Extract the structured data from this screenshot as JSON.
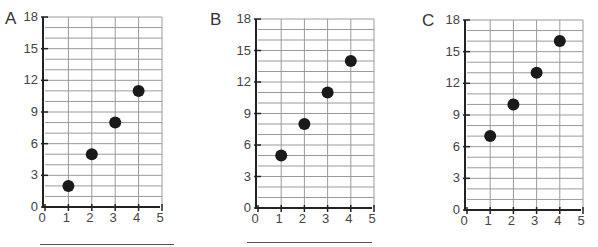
{
  "chart_data": [
    {
      "type": "scatter",
      "label": "A",
      "x": [
        1,
        2,
        3,
        4
      ],
      "y": [
        2,
        5,
        8,
        11
      ],
      "xlim": [
        0,
        5
      ],
      "ylim": [
        0,
        18
      ],
      "xticks": [
        0,
        1,
        2,
        3,
        4,
        5
      ],
      "yticks": [
        0,
        3,
        6,
        9,
        12,
        15,
        18
      ],
      "grid": true,
      "title": "",
      "xlabel": "",
      "ylabel": "",
      "has_answer_line": true
    },
    {
      "type": "scatter",
      "label": "B",
      "x": [
        1,
        2,
        3,
        4
      ],
      "y": [
        5,
        8,
        11,
        14
      ],
      "xlim": [
        0,
        5
      ],
      "ylim": [
        0,
        18
      ],
      "xticks": [
        0,
        1,
        2,
        3,
        4,
        5
      ],
      "yticks": [
        0,
        3,
        6,
        9,
        12,
        15,
        18
      ],
      "grid": true,
      "title": "",
      "xlabel": "",
      "ylabel": "",
      "has_answer_line": true
    },
    {
      "type": "scatter",
      "label": "C",
      "x": [
        1,
        2,
        3,
        4
      ],
      "y": [
        7,
        10,
        13,
        16
      ],
      "xlim": [
        0,
        5
      ],
      "ylim": [
        0,
        18
      ],
      "xticks": [
        0,
        1,
        2,
        3,
        4,
        5
      ],
      "yticks": [
        0,
        3,
        6,
        9,
        12,
        15,
        18
      ],
      "grid": true,
      "title": "",
      "xlabel": "",
      "ylabel": "",
      "has_answer_line": false
    }
  ],
  "colors": {
    "grid": "#9a9a9a",
    "axis": "#222222",
    "point": "#1a1a1a",
    "text": "#444444"
  }
}
